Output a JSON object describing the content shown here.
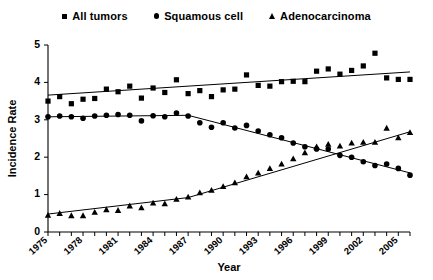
{
  "legend": {
    "position": "top-center",
    "items": [
      {
        "label": "All tumors",
        "marker": "square-marker-icon"
      },
      {
        "label": "Squamous cell",
        "marker": "circle-marker-icon"
      },
      {
        "label": "Adenocarcinoma",
        "marker": "triangle-marker-icon"
      }
    ]
  },
  "axes": {
    "y_title": "Incidence Rate",
    "x_title": "Year",
    "y_ticks": [
      "0",
      "1",
      "2",
      "3",
      "4",
      "5"
    ],
    "x_ticks": [
      "1975",
      "1978",
      "1981",
      "1984",
      "1987",
      "1990",
      "1993",
      "1996",
      "1999",
      "2002",
      "2005"
    ]
  },
  "chart_data": {
    "type": "scatter",
    "title": "",
    "subtitle": "",
    "xlabel": "Year",
    "ylabel": "Incidence Rate",
    "xlim": [
      1975,
      2006
    ],
    "ylim": [
      0,
      5
    ],
    "grid": false,
    "legend_position": "top-center",
    "x": [
      1975,
      1976,
      1977,
      1978,
      1979,
      1980,
      1981,
      1982,
      1983,
      1984,
      1985,
      1986,
      1987,
      1988,
      1989,
      1990,
      1991,
      1992,
      1993,
      1994,
      1995,
      1996,
      1997,
      1998,
      1999,
      2000,
      2001,
      2002,
      2003,
      2004,
      2005,
      2006
    ],
    "series": [
      {
        "name": "All tumors",
        "marker": "square",
        "color": "#000000",
        "values": [
          3.5,
          3.62,
          3.43,
          3.55,
          3.57,
          3.82,
          3.75,
          3.9,
          3.58,
          3.85,
          3.73,
          4.07,
          3.7,
          3.78,
          3.62,
          3.8,
          3.82,
          4.2,
          3.92,
          3.9,
          4.02,
          4.03,
          4.02,
          4.3,
          4.36,
          4.22,
          4.32,
          4.44,
          4.78,
          4.12,
          4.08,
          4.08
        ],
        "trend": {
          "type": "linear",
          "x": [
            1975,
            2006
          ],
          "y": [
            3.66,
            4.28
          ]
        }
      },
      {
        "name": "Squamous cell",
        "marker": "circle",
        "color": "#000000",
        "values": [
          3.08,
          3.1,
          3.08,
          3.04,
          3.1,
          3.12,
          3.14,
          3.12,
          2.97,
          3.11,
          3.08,
          3.18,
          3.1,
          2.92,
          2.8,
          2.92,
          2.78,
          2.85,
          2.7,
          2.6,
          2.52,
          2.38,
          2.28,
          2.22,
          2.22,
          2.05,
          2.0,
          1.88,
          1.78,
          1.82,
          1.7,
          1.52
        ],
        "trend": {
          "type": "segmented",
          "x": [
            1975,
            1987,
            2006
          ],
          "y": [
            3.08,
            3.12,
            1.58
          ]
        }
      },
      {
        "name": "Adenocarcinoma",
        "marker": "triangle",
        "color": "#000000",
        "values": [
          0.45,
          0.5,
          0.44,
          0.44,
          0.53,
          0.6,
          0.58,
          0.7,
          0.65,
          0.78,
          0.76,
          0.88,
          0.94,
          1.05,
          1.12,
          1.22,
          1.32,
          1.48,
          1.58,
          1.7,
          1.82,
          1.96,
          2.12,
          2.28,
          2.35,
          2.3,
          2.38,
          2.4,
          2.4,
          2.78,
          2.52,
          2.66
        ],
        "trend": {
          "type": "segmented",
          "x": [
            1975,
            1987,
            2006
          ],
          "y": [
            0.48,
            0.92,
            2.68
          ]
        }
      }
    ]
  }
}
